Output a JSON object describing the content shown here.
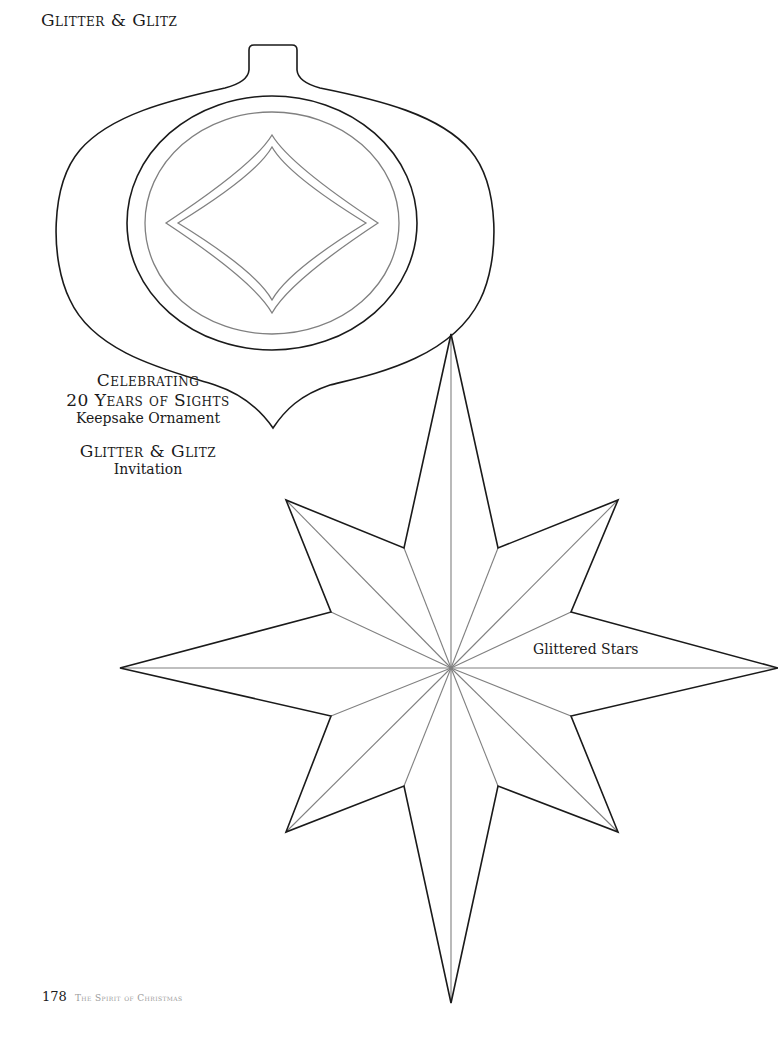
{
  "page": {
    "title": "Glitter & Glitz",
    "captions": {
      "ornament_line1": "Celebrating",
      "ornament_line2": "20 Years of Sights",
      "ornament_line3": "Keepsake Ornament",
      "invitation_line1": "Glitter & Glitz",
      "invitation_line2": "Invitation"
    },
    "star_label": "Glittered Stars",
    "footer": {
      "page_number": "178",
      "book_title": "The Spirit of Christmas"
    }
  },
  "colors": {
    "outline": "#1a1a1a",
    "inner_line": "#808080",
    "background": "#ffffff"
  }
}
